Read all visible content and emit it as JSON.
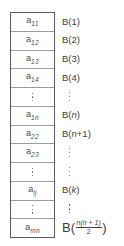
{
  "diagram": {
    "colors": {
      "outer_border": "#58595b",
      "row_divider": "#9a9b9d",
      "text": "#3f4042",
      "cell_text": "#4a4b4d",
      "background": "#ffffff"
    },
    "array": {
      "name": "matrix-element-array",
      "row_count": 12,
      "rows": [
        {
          "kind": "element",
          "base": "a",
          "sub": "11"
        },
        {
          "kind": "element",
          "base": "a",
          "sub": "12"
        },
        {
          "kind": "element",
          "base": "a",
          "sub": "13"
        },
        {
          "kind": "element",
          "base": "a",
          "sub": "14"
        },
        {
          "kind": "ellipsis",
          "text": "⋮"
        },
        {
          "kind": "element",
          "base": "a",
          "sub": "1n"
        },
        {
          "kind": "element",
          "base": "a",
          "sub": "22"
        },
        {
          "kind": "element",
          "base": "a",
          "sub": "23"
        },
        {
          "kind": "ellipsis",
          "text": "⋮"
        },
        {
          "kind": "element",
          "base": "a",
          "sub": "ij"
        },
        {
          "kind": "ellipsis",
          "text": "⋮"
        },
        {
          "kind": "element",
          "base": "a",
          "sub": "mn"
        }
      ]
    },
    "labels": {
      "name": "block-label-column",
      "row_count": 12,
      "rows": [
        {
          "kind": "label",
          "text": "B(1)"
        },
        {
          "kind": "label",
          "text": "B(2)"
        },
        {
          "kind": "label",
          "text": "B(3)"
        },
        {
          "kind": "label",
          "text": "B(4)"
        },
        {
          "kind": "dots"
        },
        {
          "kind": "label",
          "text": "B(n)",
          "italic_arg": "n"
        },
        {
          "kind": "label",
          "text": "B(n+1)",
          "italic_arg": "n"
        },
        {
          "kind": "dots"
        },
        {
          "kind": "dots"
        },
        {
          "kind": "label",
          "text": "B(k)",
          "italic_arg": "k"
        },
        {
          "kind": "dots"
        },
        {
          "kind": "fraction-label",
          "prefix": "B(",
          "numerator": "n(n + 1)",
          "denominator": "2",
          "suffix": ")"
        }
      ]
    }
  }
}
